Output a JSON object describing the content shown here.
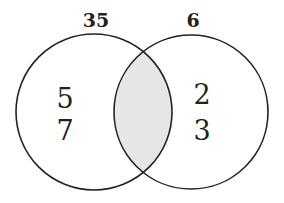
{
  "diagram": {
    "type": "venn",
    "sets": [
      {
        "label": "35",
        "elements": [
          "5",
          "7"
        ]
      },
      {
        "label": "6",
        "elements": [
          "2",
          "3"
        ]
      }
    ],
    "intersection": {
      "elements": [],
      "shaded": true
    },
    "colors": {
      "stroke": "#222222",
      "shade": "#e6e6e6",
      "background": "#ffffff"
    }
  }
}
